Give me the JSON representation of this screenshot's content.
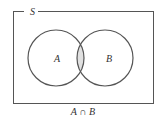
{
  "diagram": {
    "type": "venn",
    "universe_label": "S",
    "sets": [
      {
        "label": "A"
      },
      {
        "label": "B"
      }
    ],
    "shaded_region": "intersection",
    "caption": "A ∩ B",
    "colors": {
      "stroke": "#555555",
      "shade": "#e0e0e0",
      "background": "#ffffff"
    }
  }
}
